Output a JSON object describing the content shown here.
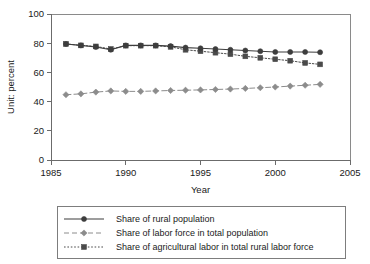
{
  "chart_data": {
    "type": "line",
    "title": "",
    "xlabel": "Year",
    "ylabel": "Unit: percent",
    "xlim": [
      1985,
      2005
    ],
    "ylim": [
      0,
      100
    ],
    "xticks": [
      1985,
      1990,
      1995,
      2000,
      2005
    ],
    "yticks": [
      0,
      20,
      40,
      60,
      80,
      100
    ],
    "grid": false,
    "legend_position": "below-plot",
    "x": [
      1986,
      1987,
      1988,
      1989,
      1990,
      1991,
      1992,
      1993,
      1994,
      1995,
      1996,
      1997,
      1998,
      1999,
      2000,
      2001,
      2002,
      2003
    ],
    "series": [
      {
        "name": "Share of rural population",
        "line_style": "solid",
        "marker": "circle",
        "color": "#3d3d3d",
        "values": [
          79.5,
          78.5,
          77.4,
          75.5,
          78.5,
          78.5,
          78.5,
          78.0,
          77.0,
          76.5,
          76.0,
          75.5,
          75.0,
          74.5,
          74.0,
          74.0,
          74.0,
          73.8
        ]
      },
      {
        "name": "Share of labor force in total population",
        "line_style": "dashed",
        "marker": "diamond",
        "color": "#8c8c8c",
        "values": [
          44.7,
          45.3,
          46.5,
          47.3,
          47.0,
          47.0,
          47.3,
          47.6,
          47.8,
          48.0,
          48.3,
          48.6,
          49.0,
          49.5,
          50.0,
          50.6,
          51.2,
          51.8
        ]
      },
      {
        "name": "Share of agricultural labor in total rural labor force",
        "line_style": "dotted",
        "marker": "square",
        "color": "#4a4a4a",
        "values": [
          79.5,
          78.5,
          77.8,
          76.0,
          78.3,
          78.3,
          78.3,
          77.5,
          75.5,
          74.5,
          73.5,
          72.5,
          71.0,
          70.0,
          69.0,
          68.0,
          66.5,
          65.5
        ]
      }
    ]
  },
  "legend": {
    "entries": [
      {
        "label": "Share of rural population"
      },
      {
        "label": "Share of labor force in total population"
      },
      {
        "label": "Share of agricultural labor in total rural labor force"
      }
    ]
  },
  "axes": {
    "x_title": "Year",
    "y_title": "Unit: percent",
    "x_tick_labels": [
      "1985",
      "1990",
      "1995",
      "2000",
      "2005"
    ],
    "y_tick_labels": [
      "0",
      "20",
      "40",
      "60",
      "80",
      "100"
    ]
  }
}
